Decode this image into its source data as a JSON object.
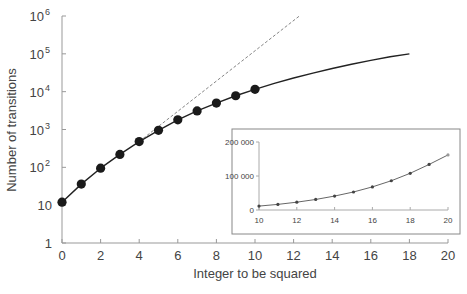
{
  "chart_data": {
    "type": "line",
    "title": "",
    "xlabel": "Integer to be squared",
    "ylabel": "Number of transitions",
    "yscale": "log",
    "xlim": [
      0,
      20
    ],
    "ylim": [
      1,
      1000000
    ],
    "x_ticks": [
      0,
      2,
      4,
      6,
      8,
      10,
      12,
      14,
      16,
      18,
      20
    ],
    "y_ticks": [
      {
        "value": 1,
        "label": "1"
      },
      {
        "value": 10,
        "label": "10"
      },
      {
        "value": 100,
        "label": "10",
        "sup": "2"
      },
      {
        "value": 1000,
        "label": "10",
        "sup": "3"
      },
      {
        "value": 10000,
        "label": "10",
        "sup": "4"
      },
      {
        "value": 100000,
        "label": "10",
        "sup": "5"
      },
      {
        "value": 1000000,
        "label": "10",
        "sup": "6"
      }
    ],
    "series": [
      {
        "name": "measured points",
        "style": "markers",
        "x": [
          0,
          1,
          2,
          3,
          4,
          5,
          6,
          7,
          8,
          9,
          10
        ],
        "y": [
          12,
          36,
          95,
          220,
          480,
          950,
          1800,
          3100,
          5000,
          7800,
          11500
        ]
      },
      {
        "name": "fit curve",
        "style": "solid",
        "x": [
          0,
          1,
          2,
          3,
          4,
          5,
          6,
          7,
          8,
          9,
          10,
          11,
          12,
          13,
          14,
          15,
          16,
          17,
          18
        ],
        "y": [
          12,
          36,
          95,
          220,
          480,
          950,
          1800,
          3100,
          5000,
          7800,
          11500,
          16500,
          23000,
          31000,
          41000,
          53000,
          67000,
          84000,
          100000
        ]
      },
      {
        "name": "exponential extrapolation",
        "style": "dashed",
        "x": [
          4,
          12.3
        ],
        "y": [
          480,
          1000000
        ]
      }
    ],
    "inset": {
      "type": "line",
      "yscale": "linear",
      "xlim": [
        10,
        20
      ],
      "ylim": [
        0,
        200000
      ],
      "x_ticks": [
        10,
        12,
        14,
        16,
        18,
        20
      ],
      "y_ticks": [
        {
          "value": 0,
          "label": "0"
        },
        {
          "value": 100000,
          "label": "100 000"
        },
        {
          "value": 200000,
          "label": "200 000"
        }
      ],
      "x": [
        10,
        11,
        12,
        13,
        14,
        15,
        16,
        17,
        18,
        19,
        20
      ],
      "y": [
        11500,
        16500,
        23000,
        31000,
        41000,
        53000,
        68000,
        86000,
        108000,
        134000,
        162000
      ]
    }
  }
}
